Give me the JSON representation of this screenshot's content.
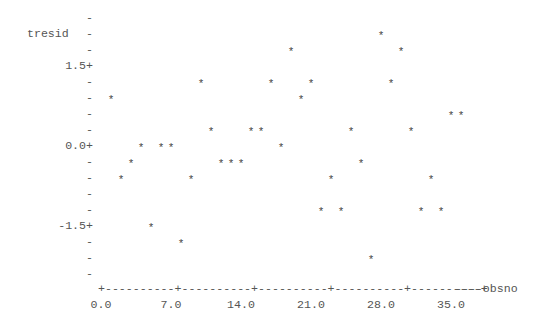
{
  "chart_data": {
    "type": "scatter",
    "title": "",
    "xlabel": "obsno",
    "ylabel": "tresid",
    "xlim": [
      0,
      36
    ],
    "ylim": [
      -2.4,
      2.4
    ],
    "grid": false,
    "x_ticks": [
      "0.0",
      "7.0",
      "14.0",
      "21.0",
      "28.0",
      "35.0"
    ],
    "y_ticks": [
      "1.5+",
      "0.0+",
      "-1.5+"
    ],
    "marker": "*",
    "points": [
      {
        "x": 1,
        "y": 0.9
      },
      {
        "x": 2,
        "y": -0.6
      },
      {
        "x": 3,
        "y": -0.3
      },
      {
        "x": 4,
        "y": 0.0
      },
      {
        "x": 5,
        "y": -1.5
      },
      {
        "x": 6,
        "y": 0.0
      },
      {
        "x": 7,
        "y": 0.0
      },
      {
        "x": 8,
        "y": -1.8
      },
      {
        "x": 9,
        "y": -0.6
      },
      {
        "x": 10,
        "y": 1.2
      },
      {
        "x": 11,
        "y": 0.3
      },
      {
        "x": 12,
        "y": -0.3
      },
      {
        "x": 13,
        "y": -0.3
      },
      {
        "x": 14,
        "y": -0.3
      },
      {
        "x": 15,
        "y": 0.3
      },
      {
        "x": 16,
        "y": 0.3
      },
      {
        "x": 17,
        "y": 1.2
      },
      {
        "x": 18,
        "y": 0.0
      },
      {
        "x": 19,
        "y": 1.8
      },
      {
        "x": 20,
        "y": 0.9
      },
      {
        "x": 21,
        "y": 1.2
      },
      {
        "x": 22,
        "y": -1.2
      },
      {
        "x": 23,
        "y": -0.6
      },
      {
        "x": 24,
        "y": -1.2
      },
      {
        "x": 25,
        "y": 0.3
      },
      {
        "x": 26,
        "y": -0.3
      },
      {
        "x": 27,
        "y": -2.1
      },
      {
        "x": 28,
        "y": 2.1
      },
      {
        "x": 29,
        "y": 1.2
      },
      {
        "x": 30,
        "y": 1.8
      },
      {
        "x": 31,
        "y": 0.3
      },
      {
        "x": 32,
        "y": -1.2
      },
      {
        "x": 33,
        "y": -0.6
      },
      {
        "x": 34,
        "y": -1.2
      },
      {
        "x": 35,
        "y": 0.6
      },
      {
        "x": 36,
        "y": 0.6
      }
    ]
  },
  "axis": {
    "ylabel": "tresid",
    "xlabel_suffix": "----obsno",
    "xaxis_line": "+----------+----------+----------+----------+----------+",
    "minor_tick": "-",
    "y_labels": {
      "top": "1.5+",
      "mid": "0.0+",
      "bottom": "-1.5+"
    },
    "x_labels": [
      "0.0",
      "7.0",
      "14.0",
      "21.0",
      "28.0",
      "35.0"
    ]
  }
}
